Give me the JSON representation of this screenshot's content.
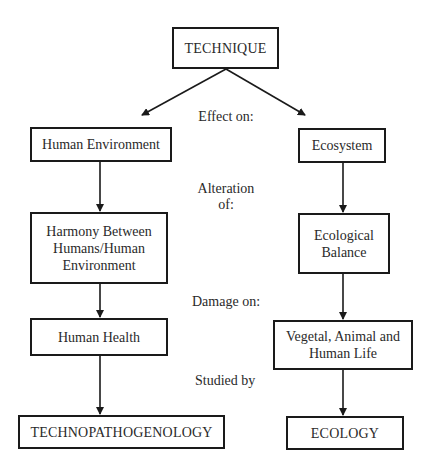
{
  "diagram": {
    "root": {
      "label": "TECHNIQUE"
    },
    "left_branch": {
      "level1": "Human Environment",
      "level2_lines": [
        "Harmony Between",
        "Humans/Human",
        "Environment"
      ],
      "level3": "Human Health",
      "level4": "TECHNOPATHOGENOLOGY"
    },
    "right_branch": {
      "level1": "Ecosystem",
      "level2_lines": [
        "Ecological",
        "Balance"
      ],
      "level3_lines": [
        "Vegetal, Animal and",
        "Human Life"
      ],
      "level4": "ECOLOGY"
    },
    "relations": {
      "effect": "Effect on:",
      "alteration_line1": "Alteration",
      "alteration_line2": "of:",
      "damage": "Damage on:",
      "studied": "Studied by"
    },
    "colors": {
      "stroke": "#1a1a1a",
      "text": "#2a2a2a",
      "background": "#ffffff"
    }
  }
}
